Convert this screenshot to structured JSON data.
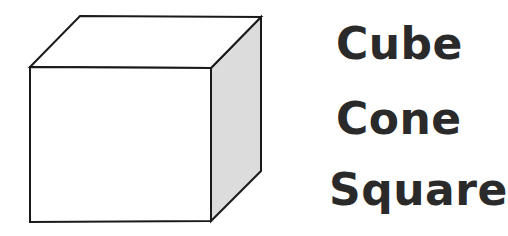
{
  "figure": {
    "shape": "cube",
    "colors": {
      "stroke": "#1a1a1a",
      "front_face": "#ffffff",
      "top_face": "#ffffff",
      "side_face": "#dcdcdc"
    }
  },
  "options": [
    {
      "label": "Cube"
    },
    {
      "label": "Cone"
    },
    {
      "label": "Square"
    }
  ],
  "colors": {
    "text": "#2a2a2a",
    "background": "#ffffff"
  }
}
